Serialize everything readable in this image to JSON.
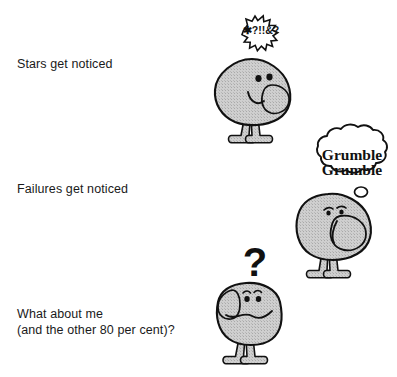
{
  "page": {
    "width": 397,
    "height": 377,
    "background_color": "#ffffff"
  },
  "colors": {
    "ink": "#1a1a1a",
    "outline": "#111111",
    "body_fill": "#c6c6c6",
    "bubble_fill": "#ffffff",
    "text": "#1a1a1a"
  },
  "captions": [
    {
      "id": "stars",
      "text": "Stars get noticed"
    },
    {
      "id": "failures",
      "text": "Failures get noticed"
    },
    {
      "id": "average",
      "line1": "What about me",
      "line2": "(and the other 80 per cent)?",
      "text": "What about me\n(and the other 80 per cent)?"
    }
  ],
  "characters": [
    {
      "id": "star-character",
      "name": "happy-blob-character",
      "mood": "happy",
      "balloon": {
        "type": "starburst",
        "text": "✱?!!&?"
      }
    },
    {
      "id": "failure-character",
      "name": "grumbling-blob-character",
      "mood": "grumpy",
      "balloon": {
        "type": "thought-cloud",
        "line1": "Grumble",
        "line2": "Grumble",
        "text": "Grumble Grumble"
      }
    },
    {
      "id": "average-character",
      "name": "puzzled-blob-character",
      "mood": "puzzled",
      "balloon": {
        "type": "question-mark",
        "text": "?"
      }
    }
  ]
}
